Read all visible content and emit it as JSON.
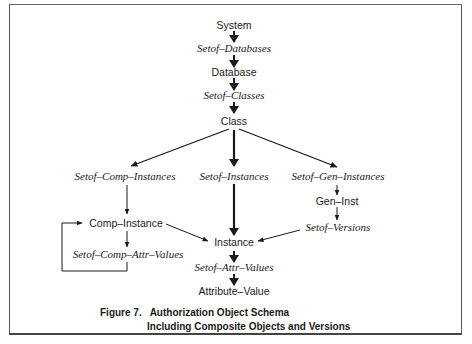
{
  "figure": {
    "caption_line1": "Figure 7.   Authorization Object Schema",
    "caption_line2": "Including Composite Objects and Versions"
  },
  "nodes": {
    "system": "System",
    "setof_databases": "Setof–Databases",
    "database": "Database",
    "setof_classes": "Setof–Classes",
    "class": "Class",
    "setof_comp_instances": "Setof–Comp–Instances",
    "setof_instances": "Setof–Instances",
    "setof_gen_instances": "Setof–Gen–Instances",
    "gen_inst": "Gen–Inst",
    "setof_versions": "Setof–Versions",
    "comp_instance": "Comp–Instance",
    "setof_comp_attr_values": "Setof–Comp–Attr–Values",
    "instance": "Instance",
    "setof_attr_values": "Setof–Attr–Values",
    "attribute_value": "Attribute–Value"
  },
  "edges": [
    {
      "from": "System",
      "to": "Setof-Databases",
      "weight": "bold"
    },
    {
      "from": "Setof-Databases",
      "to": "Database",
      "weight": "bold"
    },
    {
      "from": "Database",
      "to": "Setof-Classes",
      "weight": "bold"
    },
    {
      "from": "Setof-Classes",
      "to": "Class",
      "weight": "bold"
    },
    {
      "from": "Class",
      "to": "Setof-Comp-Instances",
      "weight": "normal"
    },
    {
      "from": "Class",
      "to": "Setof-Instances",
      "weight": "bold"
    },
    {
      "from": "Class",
      "to": "Setof-Gen-Instances",
      "weight": "normal"
    },
    {
      "from": "Setof-Comp-Instances",
      "to": "Comp-Instance",
      "weight": "thin"
    },
    {
      "from": "Setof-Gen-Instances",
      "to": "Gen-Inst",
      "weight": "thin"
    },
    {
      "from": "Gen-Inst",
      "to": "Setof-Versions",
      "weight": "thin"
    },
    {
      "from": "Setof-Versions",
      "to": "Instance",
      "weight": "thin"
    },
    {
      "from": "Comp-Instance",
      "to": "Setof-Comp-Attr-Values",
      "weight": "thin"
    },
    {
      "from": "Setof-Comp-Attr-Values",
      "to": "Comp-Instance",
      "weight": "thin",
      "style": "loop"
    },
    {
      "from": "Comp-Instance",
      "to": "Instance",
      "weight": "thin"
    },
    {
      "from": "Setof-Instances",
      "to": "Instance",
      "weight": "bold"
    },
    {
      "from": "Instance",
      "to": "Setof-Attr-Values",
      "weight": "bold"
    },
    {
      "from": "Setof-Attr-Values",
      "to": "Attribute-Value",
      "weight": "bold"
    }
  ]
}
